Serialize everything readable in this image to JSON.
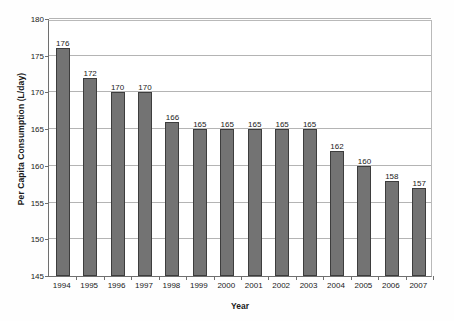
{
  "chart_data": {
    "type": "bar",
    "title": "",
    "xlabel": "Year",
    "ylabel": "Per Capita Consumption (L/day)",
    "categories": [
      "1994",
      "1995",
      "1996",
      "1997",
      "1998",
      "1999",
      "2000",
      "2001",
      "2002",
      "2003",
      "2004",
      "2005",
      "2006",
      "2007"
    ],
    "values": [
      176,
      172,
      170,
      170,
      166,
      165,
      165,
      165,
      165,
      165,
      162,
      160,
      158,
      157
    ],
    "data_labels": [
      "176",
      "172",
      "170",
      "170",
      "166",
      "165",
      "165",
      "165",
      "165",
      "165",
      "162",
      "160",
      "158",
      "157"
    ],
    "ylim": [
      145,
      180
    ],
    "ytick_values": [
      145,
      150,
      155,
      160,
      165,
      170,
      175,
      180
    ],
    "ytick_labels": [
      "145",
      "150",
      "155",
      "160",
      "165",
      "170",
      "175",
      "180"
    ],
    "grid": true,
    "grid_axis": "y",
    "legend": null,
    "series_color": "#737373",
    "series_border_color": "#3d3d3d",
    "gridline_color": "#b4b4b4",
    "axis_color": "#6f6f6f",
    "background_color": "#ffffff"
  }
}
